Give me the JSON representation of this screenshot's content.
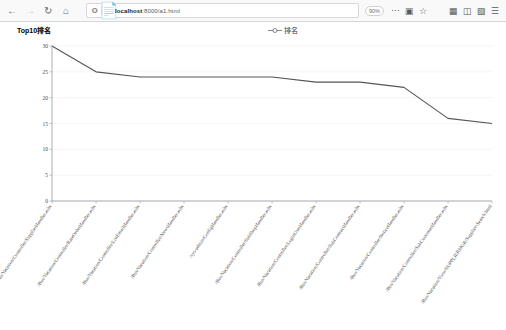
{
  "browser": {
    "back_icon": "back-arrow-icon",
    "forward_icon": "forward-arrow-icon",
    "reload_icon": "reload-icon",
    "home_icon": "home-icon",
    "url_host": "localhost",
    "url_port": ":8000",
    "url_path": "/a1.html",
    "url_full": "localhost:8000/a1.html",
    "zoom_level": "90%",
    "menu_icon": "ellipsis-icon",
    "reader_icon": "reader-view-icon",
    "bookmark_icon": "star-icon",
    "library_icon": "library-icon",
    "sidebar_icon": "sidebar-icon",
    "account_icon": "account-icon",
    "hamburger_icon": "hamburger-menu-icon"
  },
  "chart_data": {
    "type": "line",
    "title": "Top10排名",
    "legend": [
      "排名"
    ],
    "legend_position": "top-center",
    "grid": true,
    "xlabel": "",
    "ylabel": "",
    "ylim": [
      0,
      30
    ],
    "yticks": [
      0,
      5,
      10,
      15,
      20,
      25,
      30
    ],
    "categories": [
      "/Bus/Vacation/Controller/SupplierHandler.ashx",
      "/Bus/Vacation/Controller/RateOrderHandler.ashx",
      "/Bus/Vacation/Controller/ListEmailHandler.ashx",
      "/Bus/Vacation/Controller/NewsHandler.ashx",
      "/sys-admin/ConfigHandler.ashx",
      "/Bus/Vacation/Controller/SubShopHandler.ashx",
      "/Bus/Vacation/Controller/LoginUserHandler.ashx",
      "/Bus/Vacation/Controller/SubContractHandler.ashx",
      "/Bus/Vacation/Controller/NoticeHandler.ashx",
      "/Bus/Vacation/Controller/SubCustomerHandler.ashx",
      "/Bus/Vacation/View/SUPPLIERMGR/Supplier-Search.html"
    ],
    "series": [
      {
        "name": "排名",
        "values": [
          30,
          25,
          24,
          24,
          24,
          24,
          23,
          23,
          22,
          16,
          15
        ],
        "color": "#555555"
      }
    ]
  }
}
